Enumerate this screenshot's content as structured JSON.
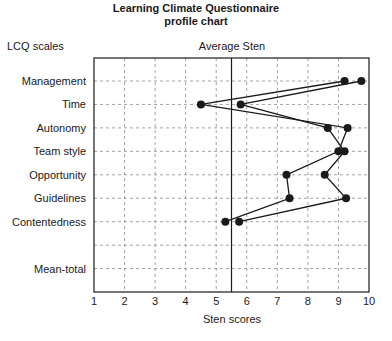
{
  "chart_data": {
    "type": "line",
    "orientation": "horizontal-profile",
    "title": "Learning Climate Questionnaire",
    "subtitle": "profile chart",
    "ylabel": "LCQ scales",
    "top_label": "Average Sten",
    "xlabel": "Sten scores",
    "xlim": [
      1,
      10
    ],
    "x_ticks": [
      1,
      2,
      3,
      4,
      5,
      6,
      7,
      8,
      9,
      10
    ],
    "reference_line": {
      "label": "Average Sten",
      "x": 5.5
    },
    "grid": true,
    "categories": [
      "Management",
      "Time",
      "Autonomy",
      "Team style",
      "Opportunity",
      "Guidelines",
      "Contentedness",
      "",
      "Mean-total"
    ],
    "series": [
      {
        "name": "Profile A",
        "values": [
          9.2,
          4.5,
          9.3,
          9.0,
          7.3,
          7.4,
          5.3,
          null,
          null
        ]
      },
      {
        "name": "Profile B",
        "values": [
          9.75,
          5.8,
          8.65,
          9.2,
          8.55,
          9.25,
          5.75,
          null,
          null
        ]
      }
    ]
  },
  "colors": {
    "line": "#1a1a1a",
    "grid": "#8a8a8a",
    "frame": "#1a1a1a",
    "marker": "#1a1a1a"
  }
}
